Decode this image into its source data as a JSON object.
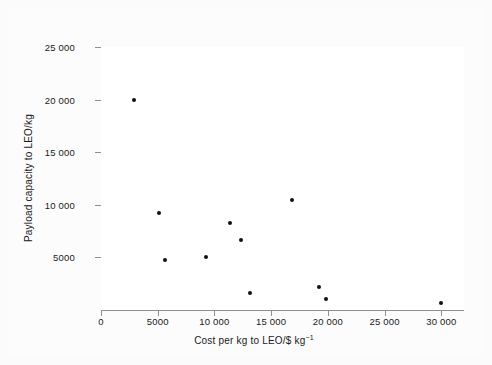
{
  "chart_data": {
    "type": "scatter",
    "title": "",
    "xlabel": "Cost per kg to LEO/$ kg",
    "xlabel_exponent": "−1",
    "ylabel": "Payload capacity to LEO/kg",
    "xlim": [
      0,
      32000
    ],
    "ylim": [
      0,
      25000
    ],
    "grid": false,
    "legend": "none",
    "marker": "filled-circle",
    "marker_color": "#111111",
    "axis_color": "#8d8f92",
    "background_color": "#fcfcfc",
    "plot_background_color": "#ffffff",
    "xticks": [
      {
        "value": 0,
        "label": "0"
      },
      {
        "value": 5000,
        "label": "5000"
      },
      {
        "value": 10000,
        "label": "10 000"
      },
      {
        "value": 15000,
        "label": "15 000"
      },
      {
        "value": 20000,
        "label": "20 000"
      },
      {
        "value": 25000,
        "label": "25 000"
      },
      {
        "value": 30000,
        "label": "30 000"
      }
    ],
    "yticks": [
      {
        "value": 5000,
        "label": "5000"
      },
      {
        "value": 10000,
        "label": "10 000"
      },
      {
        "value": 15000,
        "label": "15 000"
      },
      {
        "value": 20000,
        "label": "20 000"
      },
      {
        "value": 25000,
        "label": "25 000"
      }
    ],
    "points": [
      {
        "x": 2900,
        "y": 20000
      },
      {
        "x": 5150,
        "y": 9200
      },
      {
        "x": 5650,
        "y": 4750
      },
      {
        "x": 9300,
        "y": 5050
      },
      {
        "x": 11400,
        "y": 8300
      },
      {
        "x": 12300,
        "y": 6700
      },
      {
        "x": 13100,
        "y": 1600
      },
      {
        "x": 16800,
        "y": 10500
      },
      {
        "x": 19200,
        "y": 2150
      },
      {
        "x": 19800,
        "y": 1000
      },
      {
        "x": 30000,
        "y": 700
      }
    ]
  }
}
